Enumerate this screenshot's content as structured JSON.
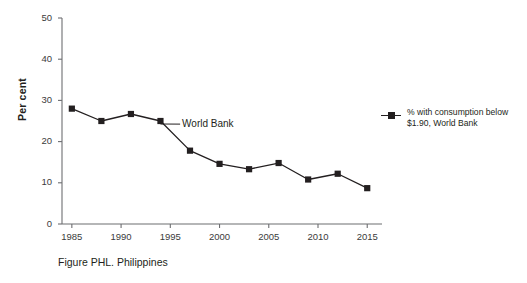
{
  "chart_data": {
    "type": "line",
    "title": "",
    "caption": "Figure PHL. Philippines",
    "xlabel": "",
    "ylabel": "Per cent",
    "xlim": [
      1984,
      2016.5
    ],
    "ylim": [
      0,
      50
    ],
    "grid": false,
    "legend_position": "right",
    "x_ticks": [
      "1985",
      "1990",
      "1995",
      "2000",
      "2005",
      "2010",
      "2015"
    ],
    "x_tick_values": [
      1985,
      1990,
      1995,
      2000,
      2005,
      2010,
      2015
    ],
    "y_ticks": [
      "0",
      "10",
      "20",
      "30",
      "40",
      "50"
    ],
    "y_tick_values": [
      0,
      10,
      20,
      30,
      40,
      50
    ],
    "annotations": [
      {
        "text": "World Bank",
        "x": 1996.2,
        "y": 24.0
      }
    ],
    "series": [
      {
        "name": "% with consumption below $1.90, World Bank",
        "legend_label_line1": "% with consumption below",
        "legend_label_line2": "$1.90, World Bank",
        "color": "#231f20",
        "marker": "square",
        "x": [
          1985,
          1988,
          1991,
          1994,
          1997,
          2000,
          2003,
          2006,
          2009,
          2012,
          2015
        ],
        "values": [
          28.0,
          25.0,
          26.7,
          25.0,
          17.8,
          14.6,
          13.3,
          14.8,
          10.8,
          12.2,
          8.7
        ]
      }
    ]
  },
  "axes": {
    "y_axis_title": "Per cent"
  }
}
